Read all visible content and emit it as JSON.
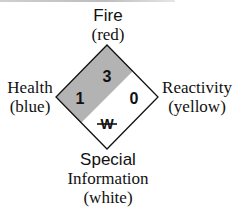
{
  "diagram": {
    "type": "NFPA 704 hazard diamond",
    "labels": {
      "fire": {
        "title": "Fire",
        "color_note": "(red)"
      },
      "health": {
        "title": "Health",
        "color_note": "(blue)"
      },
      "reactivity": {
        "title": "Reactivity",
        "color_note": "(yellow)"
      },
      "special": {
        "title": "Special",
        "title2": "Information",
        "color_note": "(white)"
      }
    },
    "values": {
      "fire": "3",
      "health": "1",
      "reactivity": "0",
      "special": "W"
    },
    "colors": {
      "shaded": "#b3b3b3",
      "unshaded": "#ffffff",
      "outline": "#111111"
    }
  }
}
